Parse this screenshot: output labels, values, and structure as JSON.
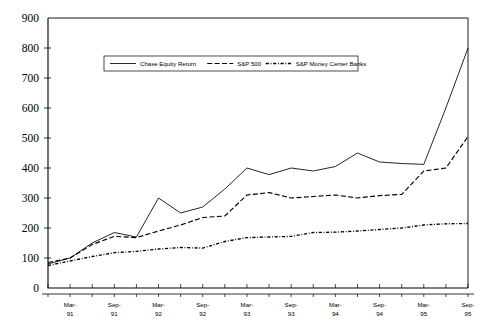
{
  "chart_data": {
    "type": "line",
    "title": "",
    "xlabel": "",
    "ylabel": "",
    "ylim": [
      0,
      900
    ],
    "ytick_step": 100,
    "yticks": [
      "0",
      "100",
      "200",
      "300",
      "400",
      "500",
      "600",
      "700",
      "800",
      "900"
    ],
    "grid": false,
    "legend_position": "top-center-inside",
    "x": [
      "Dec-90",
      "Mar-91",
      "Jun-91",
      "Sep-91",
      "Dec-91",
      "Mar-92",
      "Jun-92",
      "Sep-92",
      "Dec-92",
      "Mar-93",
      "Jun-93",
      "Sep-93",
      "Dec-93",
      "Mar-94",
      "Jun-94",
      "Sep-94",
      "Dec-94",
      "Mar-95",
      "Jun-95",
      "Sep-95"
    ],
    "xtick_labels": [
      {
        "line1": "Mar-",
        "line2": "91",
        "index": 1
      },
      {
        "line1": "Sep-",
        "line2": "91",
        "index": 3
      },
      {
        "line1": "Mar-",
        "line2": "92",
        "index": 5
      },
      {
        "line1": "Sep-",
        "line2": "92",
        "index": 7
      },
      {
        "line1": "Mar-",
        "line2": "93",
        "index": 9
      },
      {
        "line1": "Sep-",
        "line2": "93",
        "index": 11
      },
      {
        "line1": "Mar-",
        "line2": "94",
        "index": 13
      },
      {
        "line1": "Sep-",
        "line2": "94",
        "index": 15
      },
      {
        "line1": "Mar-",
        "line2": "95",
        "index": 17
      },
      {
        "line1": "Sep-",
        "line2": "95",
        "index": 19
      }
    ],
    "series": [
      {
        "name": "Chase Equity Return",
        "style": "solid",
        "values": [
          80,
          100,
          150,
          185,
          170,
          300,
          250,
          270,
          330,
          400,
          378,
          400,
          390,
          405,
          450,
          420,
          415,
          412,
          600,
          800
        ]
      },
      {
        "name": "S&P 500",
        "style": "dashed",
        "values": [
          85,
          100,
          145,
          172,
          168,
          190,
          210,
          235,
          240,
          310,
          318,
          300,
          305,
          310,
          300,
          308,
          312,
          390,
          400,
          505
        ]
      },
      {
        "name": "S&P Money Center Banks",
        "style": "dash-dot",
        "values": [
          75,
          90,
          105,
          118,
          122,
          130,
          135,
          133,
          155,
          168,
          170,
          172,
          185,
          186,
          190,
          195,
          200,
          210,
          214,
          215
        ]
      }
    ]
  },
  "legend": {
    "entries": [
      {
        "label": "Chase Equity Return",
        "style": "solid"
      },
      {
        "label": "S&P 500",
        "style": "dashed"
      },
      {
        "label": "S&P Money Center Banks",
        "style": "dash-dot"
      }
    ]
  }
}
